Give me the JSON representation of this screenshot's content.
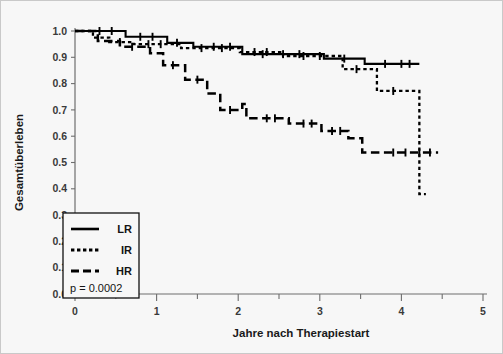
{
  "chart_data": {
    "type": "line",
    "title": "",
    "xlabel": "Jahre nach Therapiestart",
    "ylabel": "Gesamtüberleben",
    "xlim": [
      0,
      5
    ],
    "ylim": [
      0.0,
      1.0
    ],
    "xticks": [
      0,
      1,
      2,
      3,
      4,
      5
    ],
    "xtick_labels": [
      "0",
      "1",
      "2",
      "3",
      "4",
      "5"
    ],
    "xminor_ticks": [
      0.5,
      1.5,
      2.5,
      3.5,
      4.5
    ],
    "yticks": [
      0.0,
      0.1,
      0.2,
      0.3,
      0.4,
      0.5,
      0.6,
      0.7,
      0.8,
      0.9,
      1.0
    ],
    "ytick_labels": [
      "0.0",
      "0.1",
      "0.2",
      "0.3",
      "0.4",
      "0.5",
      "0.6",
      "0.7",
      "0.8",
      "0.9",
      "1.0"
    ],
    "grid": false,
    "legend_position": "lower-left",
    "annotation": "p = 0.0002",
    "series": [
      {
        "name": "LR",
        "style": "solid",
        "points": [
          [
            0.0,
            1.0
          ],
          [
            0.62,
            1.0
          ],
          [
            0.62,
            0.978
          ],
          [
            1.13,
            0.978
          ],
          [
            1.13,
            0.955
          ],
          [
            1.45,
            0.955
          ],
          [
            1.45,
            0.94
          ],
          [
            2.05,
            0.94
          ],
          [
            2.05,
            0.912
          ],
          [
            3.05,
            0.912
          ],
          [
            3.05,
            0.895
          ],
          [
            3.55,
            0.895
          ],
          [
            3.55,
            0.875
          ],
          [
            4.22,
            0.875
          ]
        ],
        "censor_x": [
          0.3,
          0.45,
          0.8,
          0.95,
          1.25,
          1.7,
          1.9,
          2.3,
          2.55,
          2.75,
          3.3,
          3.8,
          4.0,
          4.1
        ]
      },
      {
        "name": "IR",
        "style": "dotted",
        "points": [
          [
            0.0,
            1.0
          ],
          [
            0.22,
            1.0
          ],
          [
            0.22,
            0.975
          ],
          [
            0.42,
            0.975
          ],
          [
            0.42,
            0.958
          ],
          [
            0.72,
            0.958
          ],
          [
            0.72,
            0.95
          ],
          [
            1.3,
            0.95
          ],
          [
            1.3,
            0.935
          ],
          [
            2.02,
            0.935
          ],
          [
            2.02,
            0.92
          ],
          [
            2.55,
            0.92
          ],
          [
            2.55,
            0.905
          ],
          [
            3.28,
            0.905
          ],
          [
            3.28,
            0.855
          ],
          [
            3.7,
            0.855
          ],
          [
            3.7,
            0.772
          ],
          [
            4.22,
            0.772
          ],
          [
            4.22,
            0.38
          ],
          [
            4.3,
            0.38
          ]
        ],
        "censor_x": [
          0.55,
          0.9,
          1.05,
          1.55,
          1.8,
          2.2,
          2.35,
          2.8,
          3.0,
          3.45,
          3.9
        ]
      },
      {
        "name": "HR",
        "style": "dashed",
        "points": [
          [
            0.0,
            1.0
          ],
          [
            0.28,
            1.0
          ],
          [
            0.28,
            0.962
          ],
          [
            0.55,
            0.962
          ],
          [
            0.55,
            0.94
          ],
          [
            0.92,
            0.94
          ],
          [
            0.92,
            0.915
          ],
          [
            1.08,
            0.915
          ],
          [
            1.08,
            0.87
          ],
          [
            1.35,
            0.87
          ],
          [
            1.35,
            0.815
          ],
          [
            1.62,
            0.815
          ],
          [
            1.62,
            0.762
          ],
          [
            1.78,
            0.762
          ],
          [
            1.78,
            0.7
          ],
          [
            2.05,
            0.7
          ],
          [
            2.05,
            0.722
          ],
          [
            2.1,
            0.722
          ],
          [
            2.1,
            0.668
          ],
          [
            2.62,
            0.668
          ],
          [
            2.62,
            0.648
          ],
          [
            3.02,
            0.648
          ],
          [
            3.02,
            0.62
          ],
          [
            3.35,
            0.62
          ],
          [
            3.35,
            0.592
          ],
          [
            3.52,
            0.592
          ],
          [
            3.52,
            0.538
          ],
          [
            4.45,
            0.538
          ]
        ],
        "censor_x": [
          0.7,
          1.2,
          1.5,
          1.9,
          2.35,
          2.45,
          2.8,
          2.9,
          3.15,
          3.25,
          3.9,
          4.05,
          4.22,
          4.35
        ]
      }
    ]
  },
  "legend": {
    "entries": [
      {
        "label": "LR",
        "style": "solid"
      },
      {
        "label": "IR",
        "style": "dotted"
      },
      {
        "label": "HR",
        "style": "dashed"
      }
    ],
    "pvalue": "p = 0.0002"
  },
  "axes": {
    "x_title": "Jahre nach Therapiestart",
    "y_title": "Gesamtüberleben"
  },
  "colors": {
    "background": "#f7f7f7",
    "curve": "#000000",
    "axis": "#6e6e6e",
    "text": "#1a1a1a"
  }
}
